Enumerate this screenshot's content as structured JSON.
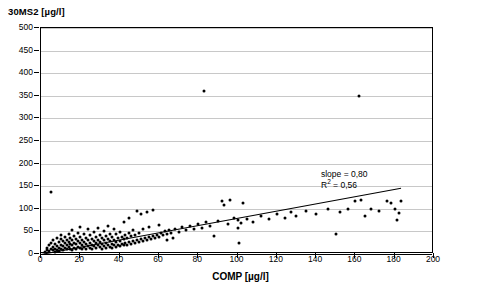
{
  "chart_data": {
    "type": "scatter",
    "title": "30MS2 [µg/l]",
    "xlabel": "COMP [µg/l]",
    "ylabel": "30MS2 [µg/l]",
    "xlim": [
      0,
      200
    ],
    "ylim": [
      0,
      500
    ],
    "xticks": [
      0,
      20,
      40,
      60,
      80,
      100,
      120,
      140,
      160,
      180,
      200
    ],
    "yticks": [
      0,
      50,
      100,
      150,
      200,
      250,
      300,
      350,
      400,
      450,
      500
    ],
    "grid": "horizontal",
    "legend": "none",
    "annotations": [
      {
        "text": "slope = 0,80",
        "x": 143,
        "y": 172
      },
      {
        "text": "R2 = 0,56",
        "x": 143,
        "y": 157
      }
    ],
    "fit": {
      "type": "line",
      "slope": 0.8,
      "intercept": 0.0,
      "r2": 0.56,
      "x_start": 0,
      "x_end": 183
    },
    "points": [
      [
        2,
        5
      ],
      [
        3,
        8
      ],
      [
        3,
        14
      ],
      [
        4,
        6
      ],
      [
        4,
        19
      ],
      [
        5,
        10
      ],
      [
        5,
        25
      ],
      [
        5,
        138
      ],
      [
        6,
        8
      ],
      [
        6,
        16
      ],
      [
        6,
        30
      ],
      [
        7,
        12
      ],
      [
        7,
        22
      ],
      [
        7,
        5
      ],
      [
        8,
        9
      ],
      [
        8,
        18
      ],
      [
        8,
        35
      ],
      [
        9,
        14
      ],
      [
        9,
        26
      ],
      [
        9,
        6
      ],
      [
        10,
        11
      ],
      [
        10,
        20
      ],
      [
        10,
        33
      ],
      [
        10,
        42
      ],
      [
        11,
        8
      ],
      [
        11,
        17
      ],
      [
        11,
        28
      ],
      [
        12,
        13
      ],
      [
        12,
        24
      ],
      [
        12,
        38
      ],
      [
        13,
        10
      ],
      [
        13,
        21
      ],
      [
        13,
        31
      ],
      [
        14,
        15
      ],
      [
        14,
        27
      ],
      [
        14,
        45
      ],
      [
        15,
        12
      ],
      [
        15,
        23
      ],
      [
        15,
        36
      ],
      [
        16,
        9
      ],
      [
        16,
        19
      ],
      [
        16,
        30
      ],
      [
        16,
        52
      ],
      [
        17,
        14
      ],
      [
        17,
        25
      ],
      [
        17,
        40
      ],
      [
        18,
        11
      ],
      [
        18,
        22
      ],
      [
        18,
        34
      ],
      [
        19,
        16
      ],
      [
        19,
        28
      ],
      [
        19,
        47
      ],
      [
        20,
        13
      ],
      [
        20,
        24
      ],
      [
        20,
        38
      ],
      [
        20,
        60
      ],
      [
        21,
        10
      ],
      [
        21,
        20
      ],
      [
        21,
        32
      ],
      [
        22,
        15
      ],
      [
        22,
        27
      ],
      [
        22,
        44
      ],
      [
        23,
        12
      ],
      [
        23,
        23
      ],
      [
        23,
        36
      ],
      [
        24,
        18
      ],
      [
        24,
        30
      ],
      [
        24,
        55
      ],
      [
        25,
        14
      ],
      [
        25,
        25
      ],
      [
        25,
        41
      ],
      [
        26,
        11
      ],
      [
        26,
        21
      ],
      [
        26,
        33
      ],
      [
        27,
        17
      ],
      [
        27,
        29
      ],
      [
        27,
        48
      ],
      [
        28,
        13
      ],
      [
        28,
        24
      ],
      [
        28,
        38
      ],
      [
        29,
        19
      ],
      [
        29,
        31
      ],
      [
        29,
        58
      ],
      [
        30,
        15
      ],
      [
        30,
        26
      ],
      [
        30,
        43
      ],
      [
        31,
        12
      ],
      [
        31,
        22
      ],
      [
        31,
        35
      ],
      [
        32,
        18
      ],
      [
        32,
        30
      ],
      [
        32,
        50
      ],
      [
        33,
        14
      ],
      [
        33,
        25
      ],
      [
        33,
        40
      ],
      [
        34,
        20
      ],
      [
        34,
        33
      ],
      [
        34,
        62
      ],
      [
        35,
        16
      ],
      [
        35,
        28
      ],
      [
        35,
        45
      ],
      [
        36,
        13
      ],
      [
        36,
        23
      ],
      [
        36,
        37
      ],
      [
        37,
        19
      ],
      [
        37,
        31
      ],
      [
        37,
        56
      ],
      [
        38,
        15
      ],
      [
        38,
        27
      ],
      [
        38,
        44
      ],
      [
        39,
        21
      ],
      [
        39,
        35
      ],
      [
        40,
        17
      ],
      [
        40,
        29
      ],
      [
        40,
        48
      ],
      [
        41,
        23
      ],
      [
        41,
        38
      ],
      [
        42,
        19
      ],
      [
        42,
        33
      ],
      [
        42,
        70
      ],
      [
        43,
        25
      ],
      [
        43,
        42
      ],
      [
        44,
        21
      ],
      [
        44,
        36
      ],
      [
        45,
        27
      ],
      [
        45,
        46
      ],
      [
        45,
        80
      ],
      [
        46,
        23
      ],
      [
        46,
        39
      ],
      [
        47,
        29
      ],
      [
        47,
        52
      ],
      [
        48,
        25
      ],
      [
        48,
        43
      ],
      [
        49,
        31
      ],
      [
        49,
        95
      ],
      [
        50,
        27
      ],
      [
        50,
        47
      ],
      [
        51,
        33
      ],
      [
        51,
        88
      ],
      [
        52,
        29
      ],
      [
        52,
        55
      ],
      [
        53,
        35
      ],
      [
        54,
        31
      ],
      [
        54,
        92
      ],
      [
        55,
        37
      ],
      [
        55,
        60
      ],
      [
        56,
        33
      ],
      [
        57,
        40
      ],
      [
        57,
        98
      ],
      [
        58,
        35
      ],
      [
        59,
        43
      ],
      [
        60,
        38
      ],
      [
        60,
        64
      ],
      [
        61,
        47
      ],
      [
        62,
        41
      ],
      [
        63,
        50
      ],
      [
        64,
        44
      ],
      [
        64,
        30
      ],
      [
        65,
        53
      ],
      [
        66,
        46
      ],
      [
        67,
        35
      ],
      [
        68,
        56
      ],
      [
        70,
        48
      ],
      [
        72,
        60
      ],
      [
        74,
        52
      ],
      [
        76,
        62
      ],
      [
        78,
        55
      ],
      [
        80,
        66
      ],
      [
        82,
        58
      ],
      [
        83,
        360
      ],
      [
        84,
        70
      ],
      [
        86,
        62
      ],
      [
        88,
        40
      ],
      [
        90,
        72
      ],
      [
        92,
        118
      ],
      [
        93,
        108
      ],
      [
        95,
        66
      ],
      [
        96,
        120
      ],
      [
        98,
        80
      ],
      [
        100,
        58
      ],
      [
        100,
        75
      ],
      [
        101,
        25
      ],
      [
        102,
        68
      ],
      [
        103,
        112
      ],
      [
        105,
        78
      ],
      [
        108,
        70
      ],
      [
        112,
        85
      ],
      [
        116,
        78
      ],
      [
        120,
        88
      ],
      [
        124,
        80
      ],
      [
        127,
        92
      ],
      [
        130,
        85
      ],
      [
        135,
        95
      ],
      [
        140,
        88
      ],
      [
        146,
        100
      ],
      [
        150,
        45
      ],
      [
        152,
        92
      ],
      [
        156,
        100
      ],
      [
        160,
        118
      ],
      [
        162,
        350
      ],
      [
        163,
        120
      ],
      [
        165,
        85
      ],
      [
        168,
        100
      ],
      [
        172,
        95
      ],
      [
        176,
        118
      ],
      [
        178,
        112
      ],
      [
        180,
        100
      ],
      [
        181,
        75
      ],
      [
        182,
        90
      ],
      [
        183,
        118
      ]
    ]
  }
}
